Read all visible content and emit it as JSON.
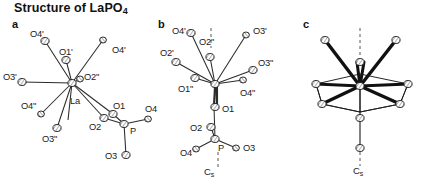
{
  "figure": {
    "title_text": "Structure of LaPO",
    "title_sub": "4",
    "background": "#ffffff",
    "ink": "#1a1a1a"
  },
  "panels": [
    {
      "id": "a",
      "letter": "a",
      "center_atom": "La",
      "description": "Coordination environment of La with nine oxygen neighbours and one PO4 tetrahedron"
    },
    {
      "id": "b",
      "letter": "b",
      "center_atom": "La",
      "description": "Same polyhedron viewed down the mirror plane with Cs axis marked"
    },
    {
      "id": "c",
      "letter": "c",
      "center_atom": "La",
      "description": "Polyhedron skeleton emphasising bold bonds with Cs axis marked"
    }
  ],
  "labels": {
    "panel_a": [
      {
        "name": "O4'",
        "x": 30,
        "y": 29
      },
      {
        "name": "O1'",
        "x": 59,
        "y": 47
      },
      {
        "name": "O4'",
        "x": 112,
        "y": 45
      },
      {
        "name": "O3'",
        "x": 3,
        "y": 72
      },
      {
        "name": "O2\"",
        "x": 84,
        "y": 79
      },
      {
        "name": "La",
        "x": 70,
        "y": 103
      },
      {
        "name": "O4\"",
        "x": 21,
        "y": 105
      },
      {
        "name": "O3\"",
        "x": 42,
        "y": 137
      },
      {
        "name": "O1",
        "x": 116,
        "y": 108
      },
      {
        "name": "O2",
        "x": 92,
        "y": 125
      },
      {
        "name": "O4",
        "x": 145,
        "y": 108
      },
      {
        "name": "P",
        "x": 131,
        "y": 131
      },
      {
        "name": "O3",
        "x": 113,
        "y": 159
      }
    ],
    "panel_b": [
      {
        "name": "O4'",
        "x": 174,
        "y": 29
      },
      {
        "name": "O2\"",
        "x": 204,
        "y": 34
      },
      {
        "name": "O3'",
        "x": 240,
        "y": 27
      },
      {
        "name": "O2'",
        "x": 163,
        "y": 50
      },
      {
        "name": "O3\"",
        "x": 247,
        "y": 58
      },
      {
        "name": "O1\"",
        "x": 178,
        "y": 85
      },
      {
        "name": "O4\"",
        "x": 245,
        "y": 88
      },
      {
        "name": "O1",
        "x": 222,
        "y": 112
      },
      {
        "name": "O2",
        "x": 192,
        "y": 133
      },
      {
        "name": "O4",
        "x": 186,
        "y": 155
      },
      {
        "name": "P",
        "x": 225,
        "y": 152
      },
      {
        "name": "O3",
        "x": 241,
        "y": 146
      }
    ],
    "panel_c": [],
    "symmetry_axes": [
      {
        "panel": "b",
        "text": "C",
        "sub": "s",
        "x": 206,
        "y": 172
      },
      {
        "panel": "c",
        "text": "C",
        "sub": "s",
        "x": 353,
        "y": 171
      }
    ]
  },
  "panel_letters": [
    {
      "label": "a",
      "x": 12,
      "y": 24
    },
    {
      "label": "b",
      "x": 158,
      "y": 24
    },
    {
      "label": "c",
      "x": 303,
      "y": 24
    }
  ],
  "colors": {
    "ink": "#1a1a1a",
    "bond": "#2b2b2b",
    "atom_fill": "#ffffff",
    "atom_stroke": "#1a1a1a",
    "dashed_axis": "#555555"
  }
}
